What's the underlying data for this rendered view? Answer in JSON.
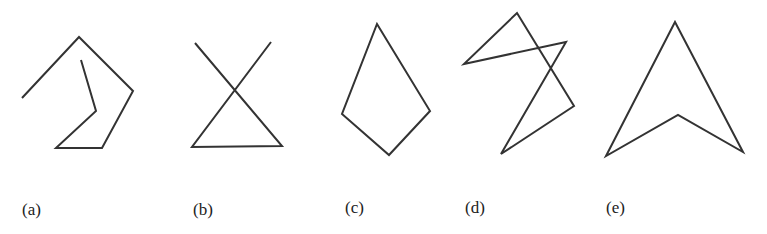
{
  "stroke_color": "#333333",
  "figures": [
    {
      "label": "(a)",
      "closed": false,
      "points": [
        [
          22,
          98
        ],
        [
          79,
          37
        ],
        [
          133,
          91
        ],
        [
          102,
          148
        ],
        [
          56,
          148
        ],
        [
          96,
          111
        ],
        [
          81,
          60
        ]
      ],
      "label_pos": [
        22,
        200
      ]
    },
    {
      "label": "(b)",
      "closed": false,
      "points": [
        [
          195,
          43
        ],
        [
          282,
          146
        ],
        [
          192,
          147
        ],
        [
          271,
          42
        ]
      ],
      "label_pos": [
        193,
        200
      ]
    },
    {
      "label": "(c)",
      "closed": true,
      "points": [
        [
          377,
          24
        ],
        [
          430,
          111
        ],
        [
          389,
          155
        ],
        [
          342,
          114
        ]
      ],
      "label_pos": [
        345,
        198
      ]
    },
    {
      "label": "(d)",
      "closed": true,
      "points": [
        [
          517,
          13
        ],
        [
          574,
          106
        ],
        [
          501,
          154
        ],
        [
          566,
          42
        ],
        [
          464,
          64
        ]
      ],
      "label_pos": [
        465,
        198
      ]
    },
    {
      "label": "(e)",
      "closed": true,
      "points": [
        [
          675,
          22
        ],
        [
          743,
          152
        ],
        [
          678,
          115
        ],
        [
          606,
          156
        ]
      ],
      "label_pos": [
        606,
        198
      ]
    }
  ]
}
